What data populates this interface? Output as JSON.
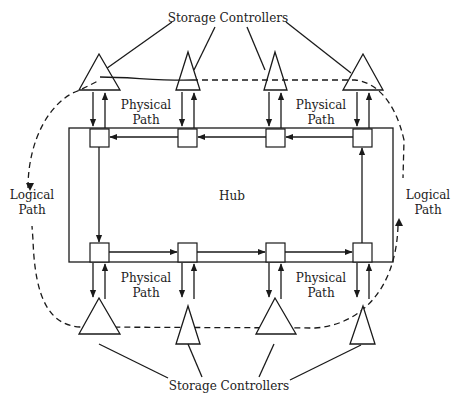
{
  "diagram": {
    "title_top": "Storage Controllers",
    "title_bottom": "Storage Controllers",
    "hub_label": "Hub",
    "physical_path_labels": [
      {
        "line1": "Physical",
        "line2": "Path",
        "position": "top-left"
      },
      {
        "line1": "Physical",
        "line2": "Path",
        "position": "top-right"
      },
      {
        "line1": "Physical",
        "line2": "Path",
        "position": "bottom-left"
      },
      {
        "line1": "Physical",
        "line2": "Path",
        "position": "bottom-right"
      }
    ],
    "logical_path_labels": [
      {
        "line1": "Logical",
        "line2": "Path",
        "position": "left"
      },
      {
        "line1": "Logical",
        "line2": "Path",
        "position": "right"
      }
    ],
    "nodes": {
      "top": 4,
      "bottom": 4
    },
    "storage_controllers": {
      "top": 4,
      "bottom": 4
    },
    "colors": {
      "stroke": "#1a1a1a",
      "background": "#ffffff"
    }
  }
}
